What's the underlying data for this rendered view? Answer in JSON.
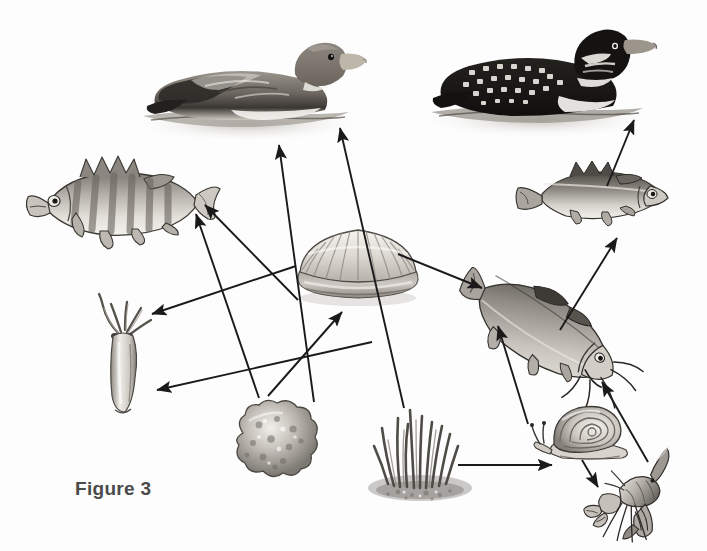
{
  "figure": {
    "caption": "Figure 3",
    "caption_x": 75,
    "caption_y": 478,
    "width": 707,
    "height": 551,
    "background": "#ffffff",
    "ink": "#1a1a1a",
    "type": "food-web-diagram"
  },
  "organisms": [
    {
      "id": "duck",
      "label": "Duck",
      "x": 135,
      "y": 28,
      "w": 230,
      "h": 110,
      "role": "top predator / waterfowl"
    },
    {
      "id": "loon",
      "label": "Loon",
      "x": 425,
      "y": 22,
      "w": 235,
      "h": 115,
      "role": "top predator / waterfowl"
    },
    {
      "id": "perch",
      "label": "Perch",
      "x": 22,
      "y": 145,
      "w": 200,
      "h": 110,
      "role": "predatory fish"
    },
    {
      "id": "small-fish",
      "label": "Small Fish",
      "x": 512,
      "y": 152,
      "w": 160,
      "h": 85,
      "role": "prey fish"
    },
    {
      "id": "clam",
      "label": "Clam",
      "x": 288,
      "y": 218,
      "w": 140,
      "h": 95,
      "role": "filter feeder / mollusk"
    },
    {
      "id": "hydra",
      "label": "Hydra",
      "x": 85,
      "y": 292,
      "w": 80,
      "h": 125,
      "role": "cnidarian predator"
    },
    {
      "id": "catfish",
      "label": "Catfish",
      "x": 448,
      "y": 275,
      "w": 185,
      "h": 115,
      "role": "bottom-feeding fish"
    },
    {
      "id": "sponge",
      "label": "Sponge",
      "x": 225,
      "y": 395,
      "w": 100,
      "h": 85,
      "role": "filter feeder"
    },
    {
      "id": "plants",
      "label": "Aquatic Plants",
      "x": 360,
      "y": 400,
      "w": 120,
      "h": 110,
      "role": "producer"
    },
    {
      "id": "snail",
      "label": "Snail",
      "x": 530,
      "y": 398,
      "w": 110,
      "h": 75,
      "role": "grazer / mollusk"
    },
    {
      "id": "crayfish",
      "label": "Crayfish",
      "x": 572,
      "y": 452,
      "w": 120,
      "h": 95,
      "role": "omnivore / crustacean"
    }
  ],
  "arrows": [
    {
      "id": "sponge-to-perch",
      "from": "sponge",
      "to": "perch",
      "x1": 259,
      "y1": 398,
      "x2": 196,
      "y2": 214
    },
    {
      "id": "clam-to-perch",
      "from": "clam",
      "to": "perch",
      "x1": 298,
      "y1": 300,
      "x2": 205,
      "y2": 205
    },
    {
      "id": "sponge-to-clam",
      "from": "sponge",
      "to": "clam",
      "x1": 268,
      "y1": 396,
      "x2": 342,
      "y2": 312
    },
    {
      "id": "clam-to-hydra",
      "from": "clam",
      "to": "hydra",
      "x1": 296,
      "y1": 266,
      "x2": 152,
      "y2": 314
    },
    {
      "id": "plants-to-hydra",
      "from": "plants",
      "to": "hydra",
      "x1": 372,
      "y1": 342,
      "x2": 157,
      "y2": 390
    },
    {
      "id": "sponge-to-duck",
      "from": "sponge",
      "to": "duck",
      "x1": 314,
      "y1": 402,
      "x2": 279,
      "y2": 145
    },
    {
      "id": "plants-to-duck",
      "from": "plants",
      "to": "duck",
      "x1": 404,
      "y1": 408,
      "x2": 340,
      "y2": 128
    },
    {
      "id": "clam-to-catfish",
      "from": "clam",
      "to": "catfish",
      "x1": 398,
      "y1": 254,
      "x2": 482,
      "y2": 288
    },
    {
      "id": "plants-to-snail",
      "from": "plants",
      "to": "snail",
      "x1": 458,
      "y1": 465,
      "x2": 552,
      "y2": 465
    },
    {
      "id": "snail-to-crayfish",
      "from": "snail",
      "to": "crayfish",
      "x1": 582,
      "y1": 460,
      "x2": 598,
      "y2": 487
    },
    {
      "id": "crayfish-to-catfish",
      "from": "crayfish",
      "to": "catfish",
      "x1": 648,
      "y1": 462,
      "x2": 602,
      "y2": 382
    },
    {
      "id": "snail-to-catfish",
      "from": "snail",
      "to": "catfish",
      "x1": 528,
      "y1": 424,
      "x2": 498,
      "y2": 326
    },
    {
      "id": "catfish-to-small-fish",
      "from": "catfish",
      "to": "small-fish",
      "x1": 560,
      "y1": 330,
      "x2": 617,
      "y2": 238
    },
    {
      "id": "small-fish-to-loon",
      "from": "small-fish",
      "to": "loon",
      "x1": 607,
      "y1": 186,
      "x2": 634,
      "y2": 120
    }
  ]
}
